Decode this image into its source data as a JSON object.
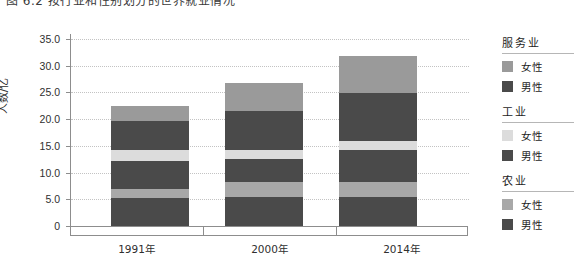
{
  "caption": "图 6.2   按行业和性别划分的世界就业情况",
  "chart_data": {
    "type": "bar",
    "stacked": true,
    "title": "图 6.2   按行业和性别划分的世界就业情况",
    "xlabel": "",
    "ylabel": "人数/亿",
    "categories": [
      "1991年",
      "2000年",
      "2014年"
    ],
    "ylim": [
      0,
      35
    ],
    "yticks": [
      "0",
      "5.0",
      "10.0",
      "15.0",
      "20.0",
      "25.0",
      "30.0",
      "35.0"
    ],
    "ytick_values": [
      0,
      5,
      10,
      15,
      20,
      25,
      30,
      35
    ],
    "grid": true,
    "legend_position": "right",
    "series": [
      {
        "name": "农业 男性",
        "sector": "农业",
        "gender": "男性",
        "color": "#4a4a4a",
        "values": [
          5.2,
          5.5,
          5.4
        ]
      },
      {
        "name": "农业 女性",
        "sector": "农业",
        "gender": "女性",
        "color": "#a8a8a8",
        "values": [
          1.8,
          2.8,
          2.8
        ]
      },
      {
        "name": "工业 男性",
        "sector": "工业",
        "gender": "男性",
        "color": "#4a4a4a",
        "values": [
          5.1,
          4.3,
          6.1
        ]
      },
      {
        "name": "工业 女性",
        "sector": "工业",
        "gender": "女性",
        "color": "#dcdcdc",
        "values": [
          2.1,
          1.6,
          1.6
        ]
      },
      {
        "name": "服务业 男性",
        "sector": "服务业",
        "gender": "男性",
        "color": "#4a4a4a",
        "values": [
          5.4,
          7.3,
          9.0
        ]
      },
      {
        "name": "服务业 女性",
        "sector": "服务业",
        "gender": "女性",
        "color": "#9a9a9a",
        "values": [
          2.9,
          5.3,
          6.9
        ]
      }
    ],
    "totals": [
      22.5,
      26.8,
      31.8
    ]
  },
  "axis": {
    "y_label": "人数/亿",
    "y_ticks": [
      "35.0",
      "30.0",
      "25.0",
      "20.0",
      "15.0",
      "10.0",
      "5.0",
      "0"
    ],
    "x_labels": [
      "1991年",
      "2000年",
      "2014年"
    ]
  },
  "legend": {
    "groups": [
      {
        "title": "服务业",
        "rows": [
          {
            "label": "女性",
            "color": "#9a9a9a"
          },
          {
            "label": "男性",
            "color": "#4a4a4a"
          }
        ]
      },
      {
        "title": "工业",
        "rows": [
          {
            "label": "女性",
            "color": "#dcdcdc"
          },
          {
            "label": "男性",
            "color": "#4a4a4a"
          }
        ]
      },
      {
        "title": "农业",
        "rows": [
          {
            "label": "女性",
            "color": "#a8a8a8"
          },
          {
            "label": "男性",
            "color": "#4a4a4a"
          }
        ]
      }
    ]
  },
  "colors": {
    "axis": "#8d8d8d",
    "grid": "#c3c3c3",
    "text": "#2f2f2f",
    "dark": "#4a4a4a",
    "mid": "#9a9a9a",
    "light": "#dcdcdc",
    "agri_female": "#a8a8a8"
  }
}
